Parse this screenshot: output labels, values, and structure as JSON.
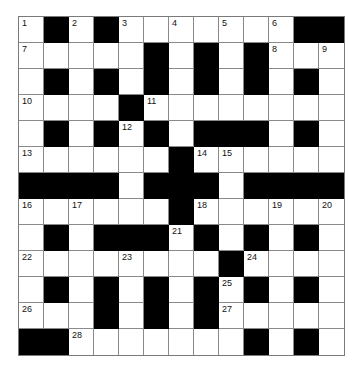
{
  "puzzle": {
    "type": "crossword",
    "rows": 13,
    "cols": 13,
    "colors": {
      "block": "#000000",
      "cell": "#ffffff",
      "line": "#8a8a8a"
    },
    "layout": [
      "0101000000011",
      "0000010101000",
      "0101010101010",
      "0000100000000",
      "0101010111010",
      "0000001000000",
      "1111011101111",
      "0000001000000",
      "0101110101010",
      "0000000010000",
      "0101010101010",
      "0001010100000",
      "1100000001010"
    ],
    "numbers": [
      {
        "r": 0,
        "c": 0,
        "n": "1"
      },
      {
        "r": 0,
        "c": 2,
        "n": "2"
      },
      {
        "r": 0,
        "c": 4,
        "n": "3"
      },
      {
        "r": 0,
        "c": 6,
        "n": "4"
      },
      {
        "r": 0,
        "c": 8,
        "n": "5"
      },
      {
        "r": 0,
        "c": 10,
        "n": "6"
      },
      {
        "r": 1,
        "c": 0,
        "n": "7"
      },
      {
        "r": 1,
        "c": 10,
        "n": "8"
      },
      {
        "r": 1,
        "c": 12,
        "n": "9"
      },
      {
        "r": 3,
        "c": 0,
        "n": "10"
      },
      {
        "r": 3,
        "c": 5,
        "n": "11"
      },
      {
        "r": 4,
        "c": 4,
        "n": "12"
      },
      {
        "r": 5,
        "c": 0,
        "n": "13"
      },
      {
        "r": 5,
        "c": 7,
        "n": "14"
      },
      {
        "r": 5,
        "c": 8,
        "n": "15"
      },
      {
        "r": 7,
        "c": 0,
        "n": "16"
      },
      {
        "r": 7,
        "c": 2,
        "n": "17"
      },
      {
        "r": 7,
        "c": 7,
        "n": "18"
      },
      {
        "r": 7,
        "c": 10,
        "n": "19"
      },
      {
        "r": 7,
        "c": 12,
        "n": "20"
      },
      {
        "r": 8,
        "c": 6,
        "n": "21"
      },
      {
        "r": 9,
        "c": 0,
        "n": "22"
      },
      {
        "r": 9,
        "c": 4,
        "n": "23"
      },
      {
        "r": 9,
        "c": 9,
        "n": "24"
      },
      {
        "r": 10,
        "c": 8,
        "n": "25"
      },
      {
        "r": 11,
        "c": 0,
        "n": "26"
      },
      {
        "r": 11,
        "c": 8,
        "n": "27"
      },
      {
        "r": 12,
        "c": 2,
        "n": "28"
      }
    ]
  }
}
